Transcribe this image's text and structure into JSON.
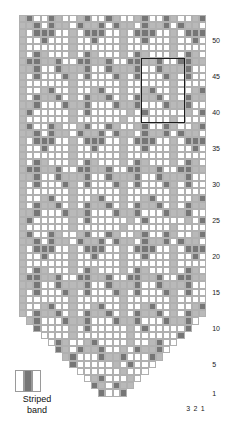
{
  "chart_meta": {
    "title": "Striped band colourwork chart",
    "colors": {
      "background": "#ffffff",
      "light": "#b9b9b9",
      "dark": "#767676",
      "grid_line": "#b0b0b0",
      "repeat_outline": "#1c1c1c",
      "label_text": "#1a1a1a"
    },
    "cell_px": 7.2,
    "grid_origin": {
      "x": 19,
      "y": 15
    },
    "columns": 26,
    "rows": 53
  },
  "legend": {
    "label_line1": "Striped",
    "label_line2": "band",
    "swatch_cells": [
      "bg",
      "dk",
      "bg"
    ]
  },
  "row_labels": [
    {
      "value": "50",
      "row": 50
    },
    {
      "value": "45",
      "row": 45
    },
    {
      "value": "40",
      "row": 40
    },
    {
      "value": "35",
      "row": 35
    },
    {
      "value": "30",
      "row": 30
    },
    {
      "value": "25",
      "row": 25
    },
    {
      "value": "20",
      "row": 20
    },
    {
      "value": "15",
      "row": 15
    },
    {
      "value": "10",
      "row": 10
    },
    {
      "value": "5",
      "row": 5
    },
    {
      "value": "1",
      "row": 1
    }
  ],
  "column_labels": [
    {
      "value": "3",
      "col": 3
    },
    {
      "value": "2",
      "col": 2
    },
    {
      "value": "1",
      "col": 1
    }
  ],
  "repeat_box": {
    "col_start": 4,
    "col_end": 9,
    "row_start": 39,
    "row_end": 47
  },
  "chart_data": {
    "type": "heatmap",
    "xlabel": "",
    "ylabel": "",
    "legend": [
      "Striped band"
    ],
    "palette": {
      "b": "#ffffff",
      "l": "#b9b9b9",
      "d": "#767676",
      "_": null
    },
    "note": "Rows are numbered bottom-up (row 1 at bottom). Each string is one row, left-to-right column 26..1. '_' means outside the piece (blank, tapered toe).",
    "grid": [
      "ldbbdlbbldbbdlbbldbbdlbbld",
      "lldbdllbdlldbdllbdlldbdllb",
      "lbdddbblbdddbblbdddbblbddd",
      "lbbdbbblbbdbbblbbdbbblbbdb",
      "lbbbbbblbbbbbblbbbbbblbbbb",
      "lbdlbbblbdlbbblbdlbbblbdlb",
      "lddlldbbddlldbbddlldbbddll",
      "lldbbdllldbbdllldbbdllldbb",
      "lbdbbbdlbdbbbdlbdbbbdlbdbb",
      "lbbbbbblbbbbbblbbbbbblbbbb",
      "lbbldbblbbldbblbbldbblbbld",
      "lbdlldblbdlldblbdlldblbdll",
      "lldbbbdlldbbbdlldbbbdlldbb",
      "ldbbbbblbdbbbbblbdbbbbblbd",
      "lbbbbbblbbbbbblbbbbbblbbbb",
      "ldbbdlbbldbbdlbbldbbdlbbld",
      "lldbdllbdlldbdllbdlldbdllb",
      "lbdddbblbdddbblbdddbblbddd",
      "lbbdbbblbbdbbblbbdbbblbbdb",
      "lbbbbbblbbbbbblbbbbbblbbbb",
      "lbdlbbblbdlbbblbdlbbblbdlb",
      "lddlldbbddlldbbddlldbbddll",
      "lldbbdllldbbdllldbbdllldbb",
      "lbdbbbdlbdbbbdlbdbbbdlbdbb",
      "lbbbbbblbbbbbblbbbbbblbbbb",
      "lbbldbblbbldbblbbldbblbbld",
      "lbdlldblbdlldblbdlldblbdll",
      "lldbbbdlldbbbdlldbbbdlldbb",
      "ldbbbbblbdbbbbblbdbbbbblbd",
      "lbbbbbblbbbbbblbbbbbblbbbb",
      "ldbbdlbbldbbdlbbldbbdlbbld",
      "lldbdllbdlldbdllbdlldbdllb",
      "lbdddbblbdddbblbdddbblbddd",
      "lbbdbbblbbdbbblbbdbbblbbdb",
      "lbbbbbblbbbbbblbbbbbblbbbb",
      "lbdlbbblbdlbbblbdlbbblbdlb",
      "lddlldbbddlldbbddlldbbddll",
      "lldbbdllldbbdllldbbdllldbb",
      "lbdbbbdlbdbbbdlbdbbbdlbdbb",
      "lbbbbbblbbbbbblbbbbbblbbbb",
      "lbbldbblbbldbblbbldbblbbld",
      "lbdlldblbdlldblbdlldblbdll",
      "_ldbbbdlldbbbdlldbbbdlldb_",
      "__dbbbblbdbbbbblbdbbbbbd__",
      "___bbbblbbbbbbblbbbbbbd___",
      "____bdlbbldbbbblbbldbb____",
      "_____dlbdlldbblbdlldb_____",
      "______ldbbbdlldbbbdl______",
      "_______dbbbbblbdbbb_______",
      "________bbbbbblbbb________",
      "_________bldbbblb_________",
      "__________dlbdll__________",
      "___________dbbd___________"
    ]
  }
}
